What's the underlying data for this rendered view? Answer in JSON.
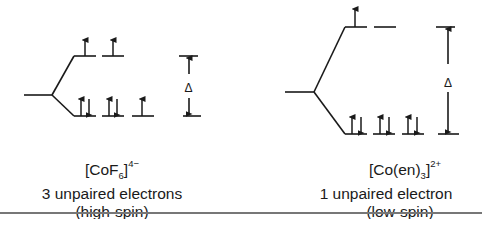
{
  "complexes": [
    {
      "id": "left",
      "formula": {
        "open": "[CoF",
        "sub": "6",
        "close": "]",
        "sup": "4−"
      },
      "unpaired": "3 unpaired electrons",
      "spin": "(high-spin)",
      "eg_electrons": [
        "up",
        "up"
      ],
      "t2g_electrons": [
        "up-down",
        "up-down",
        "up"
      ],
      "delta_label": "Δ"
    },
    {
      "id": "right",
      "formula": {
        "open": "[Co(en)",
        "sub": "3",
        "close": "]",
        "sup": "2+"
      },
      "unpaired": "1 unpaired electron",
      "spin": "(low-spin)",
      "eg_electrons": [
        "up",
        "empty"
      ],
      "t2g_electrons": [
        "up-down",
        "up-down",
        "up-down"
      ],
      "delta_label": "Δ"
    }
  ],
  "colors": {
    "line": "#1a1a1a",
    "rule": "#777777"
  }
}
